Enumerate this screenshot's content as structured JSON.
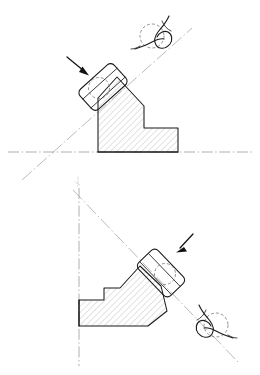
{
  "document": {
    "kind": "engineering-line-drawing",
    "title": "",
    "background_color": "#ffffff",
    "width": 260,
    "height": 375,
    "figure_count": 2,
    "has_text_labels": false
  },
  "palette": {
    "outline": "#1a1a1a",
    "outline_secondary": "#2b2b2b",
    "hatching": "#9a9a9a",
    "centerline": "#8d8d8d",
    "axis_line": "#9c9c9c",
    "hidden_edge": "#6f6f6f",
    "arrow": "#121212",
    "annotation_squiggle": "#1c1c1c",
    "faint_artifact": "#c9c9c9"
  },
  "figures": [
    {
      "id": "figure-top",
      "name": "upper-section-view",
      "description": "Hatched stepped body resting on a horizontal dash-dot datum line, with a tilted rounded-rectangle jaw block applied to its upper-left sloped face along an inclined dash-dot axis.",
      "datum": {
        "type": "horizontal-centerline",
        "y": 152,
        "x_start": 8,
        "x_end": 252
      },
      "inclined_axis": {
        "type": "dash-dot-axis",
        "from": [
          22,
          180
        ],
        "to": [
          192,
          28
        ],
        "angle_deg": -41.8
      },
      "body": {
        "name": "hatched-stepped-body",
        "hatch_angle_deg": 45,
        "hatch_spacing_px": 3.1,
        "outline_points": "98,152 98,98 117,77 144,106 144,128 178,128 178,152"
      },
      "jaw_block": {
        "name": "tilted-jaw-block",
        "center": [
          103,
          87
        ],
        "width": 46,
        "height": 27,
        "corner_radius": 5,
        "rotation_deg": -42
      },
      "hidden_circle": {
        "name": "hidden-bore-circle",
        "center": [
          99,
          88
        ],
        "radius": 10.5
      },
      "arrow": {
        "name": "direction-arrow",
        "from": [
          68,
          58
        ],
        "to": [
          88,
          75
        ],
        "direction": "down-right"
      },
      "detail_mark": {
        "name": "hand-drawn-detail-mark",
        "circle_center": [
          152,
          36
        ],
        "circle_radius": 12,
        "position": "upper-right-end-of-axis"
      }
    },
    {
      "id": "figure-bottom",
      "name": "lower-section-view",
      "description": "Mirrored variant: hatched stepped body against a vertical dash-dot datum line on the left, with the tilted rounded-rectangle jaw block applied to its lower-right sloped face along a descending dash-dot axis.",
      "datum": {
        "type": "vertical-centerline",
        "x": 79,
        "y_start": 188,
        "y_end": 366
      },
      "inclined_axis": {
        "type": "dash-dot-axis",
        "from": [
          73,
          190
        ],
        "to": [
          238,
          362
        ],
        "angle_deg": 46.2
      },
      "body": {
        "name": "hatched-stepped-body",
        "hatch_angle_deg": 45,
        "hatch_spacing_px": 3.1,
        "outline_points": "79,300 79,326 148,326 165,312 160,288 140,268 120,289 104,289 104,300"
      },
      "jaw_block": {
        "name": "tilted-jaw-block",
        "center": [
          161,
          273
        ],
        "width": 46,
        "height": 27,
        "corner_radius": 5,
        "rotation_deg": 46
      },
      "hidden_circle": {
        "name": "hidden-bore-circle",
        "center": [
          165,
          274
        ],
        "radius": 10.5
      },
      "arrow": {
        "name": "direction-arrow",
        "from": [
          192,
          235
        ],
        "to": [
          176,
          252
        ],
        "direction": "down-left"
      },
      "detail_mark": {
        "name": "hand-drawn-detail-mark",
        "circle_center": [
          216,
          325
        ],
        "circle_radius": 12,
        "position": "lower-right-end-of-axis"
      }
    }
  ]
}
